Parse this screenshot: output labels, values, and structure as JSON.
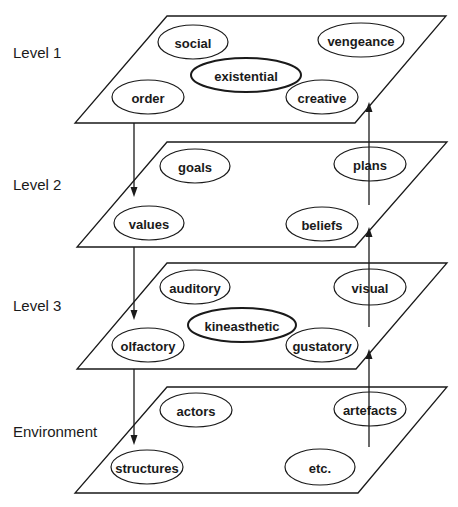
{
  "diagram": {
    "levels": [
      {
        "label": "Level 1",
        "label_pos": [
          13,
          58
        ],
        "plane": {
          "top_y": 16,
          "bottom_y": 123,
          "top_left_x": 167,
          "top_right_x": 446,
          "bottom_left_x": 75,
          "bottom_right_x": 355
        },
        "nodes": [
          {
            "text": "social",
            "cx": 193,
            "cy": 42,
            "rx": 35,
            "ry": 17,
            "bold": false
          },
          {
            "text": "vengeance",
            "cx": 361,
            "cy": 40,
            "rx": 43,
            "ry": 17,
            "bold": false
          },
          {
            "text": "existential",
            "cx": 246,
            "cy": 75,
            "rx": 55,
            "ry": 17,
            "bold": true
          },
          {
            "text": "order",
            "cx": 148,
            "cy": 97,
            "rx": 36,
            "ry": 17,
            "bold": false
          },
          {
            "text": "creative",
            "cx": 322,
            "cy": 97,
            "rx": 36,
            "ry": 17,
            "bold": false
          }
        ]
      },
      {
        "label": "Level 2",
        "label_pos": [
          13,
          190
        ],
        "plane": {
          "top_y": 142,
          "bottom_y": 247,
          "top_left_x": 167,
          "top_right_x": 447,
          "bottom_left_x": 77,
          "bottom_right_x": 355
        },
        "nodes": [
          {
            "text": "goals",
            "cx": 195,
            "cy": 166,
            "rx": 35,
            "ry": 17,
            "bold": false
          },
          {
            "text": "plans",
            "cx": 370,
            "cy": 164,
            "rx": 36,
            "ry": 17,
            "bold": false
          },
          {
            "text": "values",
            "cx": 149,
            "cy": 223,
            "rx": 35,
            "ry": 17,
            "bold": false
          },
          {
            "text": "beliefs",
            "cx": 322,
            "cy": 224,
            "rx": 36,
            "ry": 17,
            "bold": false
          }
        ]
      },
      {
        "label": "Level 3",
        "label_pos": [
          13,
          311
        ],
        "plane": {
          "top_y": 263,
          "bottom_y": 369,
          "top_left_x": 167,
          "top_right_x": 447,
          "bottom_left_x": 77,
          "bottom_right_x": 356
        },
        "nodes": [
          {
            "text": "auditory",
            "cx": 195,
            "cy": 287,
            "rx": 35,
            "ry": 17,
            "bold": false
          },
          {
            "text": "visual",
            "cx": 370,
            "cy": 287,
            "rx": 36,
            "ry": 18,
            "bold": false
          },
          {
            "text": "kineasthetic",
            "cx": 242,
            "cy": 325,
            "rx": 54,
            "ry": 17,
            "bold": true
          },
          {
            "text": "olfactory",
            "cx": 148,
            "cy": 345,
            "rx": 36,
            "ry": 17,
            "bold": false
          },
          {
            "text": "gustatory",
            "cx": 322,
            "cy": 345,
            "rx": 36,
            "ry": 17,
            "bold": false
          }
        ]
      },
      {
        "label": "Environment",
        "label_pos": [
          13,
          437
        ],
        "plane": {
          "top_y": 387,
          "bottom_y": 493,
          "top_left_x": 167,
          "top_right_x": 447,
          "bottom_left_x": 75,
          "bottom_right_x": 358
        },
        "nodes": [
          {
            "text": "actors",
            "cx": 196,
            "cy": 410,
            "rx": 36,
            "ry": 17,
            "bold": false
          },
          {
            "text": "artefacts",
            "cx": 370,
            "cy": 409,
            "rx": 36,
            "ry": 17,
            "bold": false
          },
          {
            "text": "structures",
            "cx": 147,
            "cy": 467,
            "rx": 36,
            "ry": 17,
            "bold": false
          },
          {
            "text": "etc.",
            "cx": 320,
            "cy": 467,
            "rx": 35,
            "ry": 18,
            "bold": false
          }
        ]
      }
    ],
    "arrows": [
      {
        "direction": "down",
        "x": 134,
        "y1": 123,
        "y2": 197
      },
      {
        "direction": "down",
        "x": 134,
        "y1": 247,
        "y2": 320
      },
      {
        "direction": "down",
        "x": 134,
        "y1": 369,
        "y2": 445
      },
      {
        "direction": "up",
        "x": 369,
        "y1": 205,
        "y2": 102
      },
      {
        "direction": "up",
        "x": 369,
        "y1": 327,
        "y2": 227
      },
      {
        "direction": "up",
        "x": 369,
        "y1": 447,
        "y2": 349
      }
    ]
  }
}
